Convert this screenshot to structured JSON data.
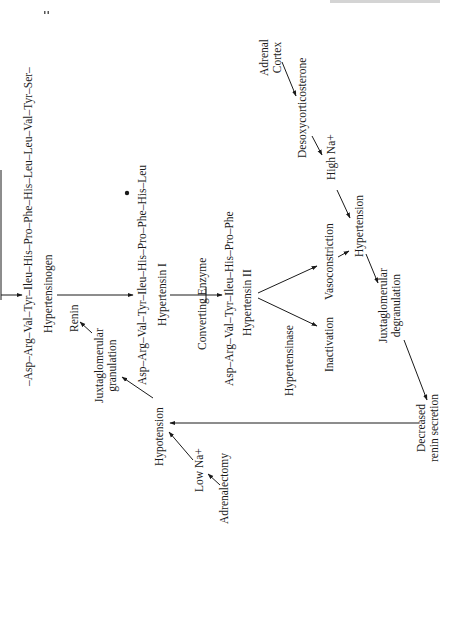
{
  "diagram": {
    "nodes": {
      "hypertensinogen_chain": "–Asp–Arg–Val–Tyr–Ileu–His–Pro–Phe–His–Leu–Leu–Val–Tyr–Ser–",
      "hypertensinogen": "Hypertensinogen",
      "renin": "Renin",
      "juxtaglomerular_granulation": [
        "Juxtaglomerular",
        "granulation"
      ],
      "hypertensin_i_chain": "Asp–Arg–Val–Tyr–Ileu–His–Pro–Phe–His–Leu",
      "hypertensin_i": "Hypertensin I",
      "converting_enzyme": "Converting Enzyme",
      "hypertensin_ii_chain": "Asp–Arg–Val–Tyr–Ileu–His–Pro–Phe",
      "hypertensin_ii": "Hypertensin II",
      "hypertensinase": "Hypertensinase",
      "vasoconstriction": "Vasoconstriction",
      "inactivation": "Inactivation",
      "adrenal_cortex": [
        "Adrenal",
        "Cortex"
      ],
      "desoxycorticosterone": "Desoxycorticosterone",
      "high_na": "High Na+",
      "hypertension": "Hypertension",
      "juxtaglomerular_degranulation": [
        "Juxtaglomerular",
        "degranulation"
      ],
      "decreased_renin_secretion": [
        "Decreased",
        "renin secretion"
      ],
      "hypotension": "Hypotension",
      "low_na": "Low Na+",
      "adrenalectomy": "Adrenalectomy"
    },
    "edges": [
      {
        "from": "hypertensinogen",
        "to": "hypertensin_i",
        "label": "Renin"
      },
      {
        "from": "hypertensin_i",
        "to": "hypertensin_ii",
        "label": "Converting Enzyme"
      },
      {
        "from": "hypertensin_ii",
        "to": "vasoconstriction"
      },
      {
        "from": "hypertensin_ii",
        "to": "inactivation",
        "label": "Hypertensinase"
      },
      {
        "from": "adrenal_cortex",
        "to": "desoxycorticosterone"
      },
      {
        "from": "desoxycorticosterone",
        "to": "high_na"
      },
      {
        "from": "high_na",
        "to": "hypertension"
      },
      {
        "from": "vasoconstriction",
        "to": "hypertension"
      },
      {
        "from": "hypertension",
        "to": "juxtaglomerular_degranulation"
      },
      {
        "from": "juxtaglomerular_degranulation",
        "to": "decreased_renin_secretion"
      },
      {
        "from": "decreased_renin_secretion",
        "to": "hypotension"
      },
      {
        "from": "adrenalectomy",
        "to": "low_na"
      },
      {
        "from": "low_na",
        "to": "hypotension"
      },
      {
        "from": "hypotension",
        "to": "juxtaglomerular_granulation"
      },
      {
        "from": "juxtaglomerular_granulation",
        "to": "renin"
      }
    ]
  }
}
